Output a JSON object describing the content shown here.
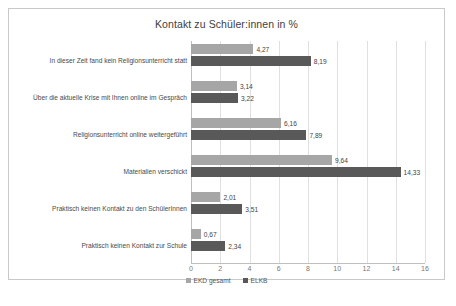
{
  "chart_data": {
    "type": "bar",
    "orientation": "horizontal",
    "title": "Kontakt zu Schüler:innen in %",
    "xlabel": "",
    "ylabel": "",
    "xlim": [
      0,
      16
    ],
    "xticks": [
      "0",
      "2",
      "4",
      "6",
      "8",
      "10",
      "12",
      "14",
      "16"
    ],
    "grid": true,
    "legend_position": "bottom",
    "categories": [
      "In dieser Zeit fand kein Religionsunterricht statt",
      "Über die aktuelle Krise mit Ihnen online im Gespräch",
      "Religionsunterricht online weitergeführt",
      "Materialien verschickt",
      "Praktisch keinen Kontakt zu den SchülerInnen",
      "Praktisch keinen Kontakt zur Schule"
    ],
    "series": [
      {
        "name": "EKD gesamt",
        "color": "#a6a6a6",
        "values": [
          4.27,
          3.14,
          6.16,
          9.64,
          2.01,
          0.67
        ],
        "labels": [
          "4,27",
          "3,14",
          "6,16",
          "9,64",
          "2,01",
          "0,67"
        ]
      },
      {
        "name": "ELKB",
        "color": "#595959",
        "values": [
          8.19,
          3.22,
          7.89,
          14.33,
          3.51,
          2.34
        ],
        "labels": [
          "8,19",
          "3,22",
          "7,89",
          "14,33",
          "3,51",
          "2,34"
        ]
      }
    ]
  }
}
